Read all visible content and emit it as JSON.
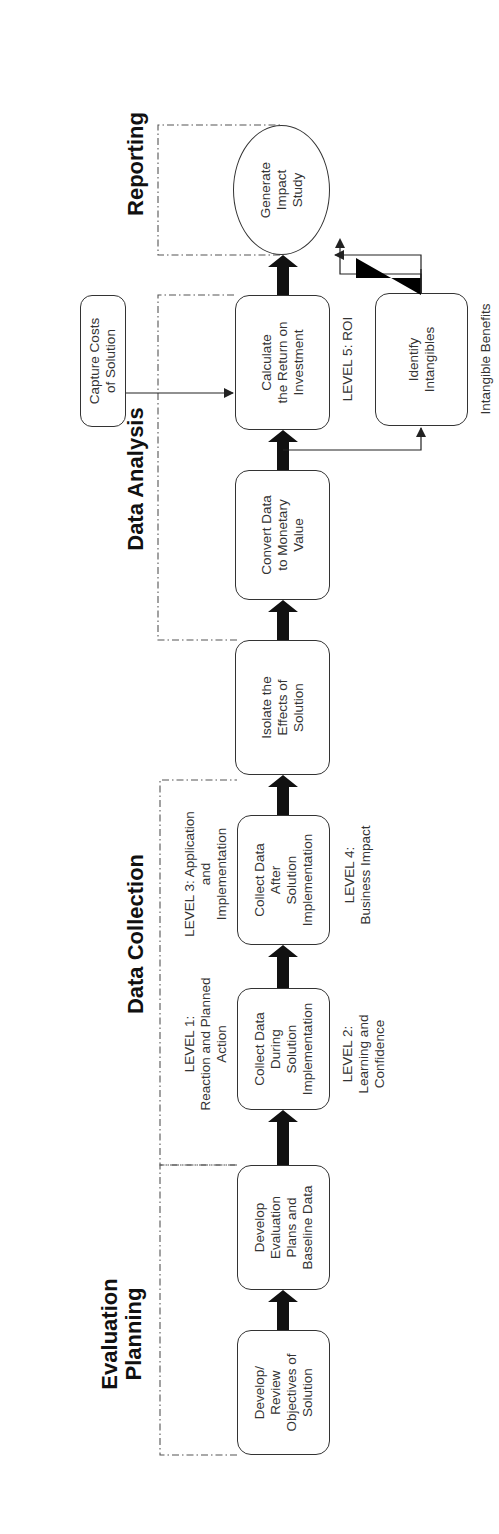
{
  "phases": {
    "evaluation_planning": "Evaluation\nPlanning",
    "data_collection": "Data Collection",
    "data_analysis": "Data Analysis",
    "reporting": "Reporting"
  },
  "steps": {
    "develop_objectives": "Develop/\nReview\nObjectives of\nSolution",
    "develop_eval_plans": "Develop\nEvaluation\nPlans and\nBaseline Data",
    "collect_during": "Collect Data\nDuring\nSolution\nImplementation",
    "collect_after": "Collect Data\nAfter\nSolution\nImplementation",
    "isolate_effects": "Isolate the\nEffects of\nSolution",
    "convert_data": "Convert Data\nto Monetary\nValue",
    "calculate_roi": "Calculate\nthe Return on\nInvestment",
    "capture_costs": "Capture Costs\nof Solution",
    "identify_intangibles": "Identify\nIntangibles",
    "generate_study": "Generate\nImpact\nStudy"
  },
  "levels": {
    "level1": "LEVEL 1:\nReaction and Planned\nAction",
    "level2": "LEVEL 2:\nLearning and\nConfidence",
    "level3": "LEVEL 3:  Application\nand\nImplementation",
    "level4": "LEVEL 4:\nBusiness Impact",
    "level5": "LEVEL 5:  ROI",
    "intangible": "Intangible Benefits"
  }
}
